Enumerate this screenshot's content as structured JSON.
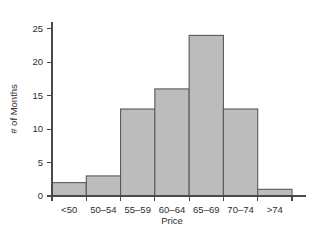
{
  "chart_data": {
    "type": "bar",
    "title": "",
    "subtitle": "",
    "xlabel": "Price",
    "ylabel": "# of Months",
    "categories": [
      "<50",
      "50–54",
      "55–59",
      "60–64",
      "65–69",
      "70–74",
      ">74"
    ],
    "values": [
      2,
      3,
      13,
      16,
      24,
      13,
      1
    ],
    "series": [
      {
        "name": "# of Months",
        "values": [
          2,
          3,
          13,
          16,
          24,
          13,
          1
        ]
      }
    ],
    "ylim": [
      0,
      26
    ],
    "yticks": [
      0,
      5,
      10,
      15,
      20,
      25
    ],
    "ytick_labels": [
      "0",
      "5",
      "10",
      "15",
      "20",
      "25"
    ],
    "grid": false,
    "legend": false,
    "legend_position": "none",
    "bar_gap": 0,
    "colors": {
      "bar_fill": "#bcbcbc",
      "bar_edge": "#5a5a5a",
      "axis": "#4a4a4a",
      "text": "#2e2e2e",
      "background": "#ffffff"
    },
    "annotations": []
  }
}
